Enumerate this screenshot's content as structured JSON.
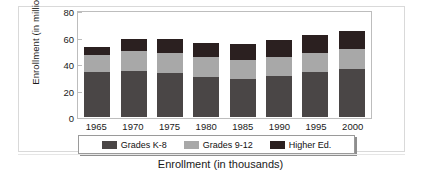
{
  "chart_data": {
    "type": "bar",
    "subtype": "stacked-bar",
    "title": "",
    "xlabel": "",
    "ylabel": "Enrollment (in millions)",
    "categories": [
      "1965",
      "1970",
      "1975",
      "1980",
      "1985",
      "1990",
      "1995",
      "2000"
    ],
    "series": [
      {
        "name": "Grades K-8",
        "color": "#4a4646",
        "values": [
          34,
          35,
          33,
          30,
          29,
          31,
          34,
          36
        ]
      },
      {
        "name": "Grades 9-12",
        "color": "#a8a8a8",
        "values": [
          13,
          15,
          15,
          15,
          14,
          14,
          14,
          15
        ]
      },
      {
        "name": "Higher Ed.",
        "color": "#2b2020",
        "values": [
          6,
          9,
          11,
          11,
          12,
          13,
          14,
          14
        ]
      }
    ],
    "totals": [
      53,
      59,
      59,
      56,
      55,
      58,
      62,
      65
    ],
    "ylim": [
      0,
      80
    ],
    "yticks": [
      0,
      20,
      40,
      60,
      80
    ],
    "grid": false,
    "legend_position": "bottom"
  },
  "axes": {
    "y_title": "Enrollment (in millions)",
    "y_tick_labels": [
      "80",
      "60",
      "40",
      "20",
      "0"
    ],
    "x_tick_labels": [
      "1965",
      "1970",
      "1975",
      "1980",
      "1985",
      "1990",
      "1995",
      "2000"
    ]
  },
  "legend": {
    "items": [
      {
        "label": "Grades K-8",
        "color": "#4a4646"
      },
      {
        "label": "Grades 9-12",
        "color": "#a8a8a8"
      },
      {
        "label": "Higher Ed.",
        "color": "#2b2020"
      }
    ]
  },
  "caption": {
    "text": "Enrollment (in thousands)"
  }
}
